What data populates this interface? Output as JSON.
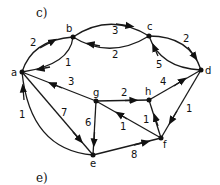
{
  "panel_labels": {
    "top": "c)",
    "bottom": "e)"
  },
  "nodes": [
    {
      "id": "a",
      "label": "a"
    },
    {
      "id": "b",
      "label": "b"
    },
    {
      "id": "c",
      "label": "c"
    },
    {
      "id": "d",
      "label": "d"
    },
    {
      "id": "e",
      "label": "e"
    },
    {
      "id": "f",
      "label": "f"
    },
    {
      "id": "g",
      "label": "g"
    },
    {
      "id": "h",
      "label": "h"
    }
  ],
  "edges": [
    {
      "from": "a",
      "to": "b",
      "weight": "2"
    },
    {
      "from": "b",
      "to": "a",
      "weight": "1"
    },
    {
      "from": "b",
      "to": "c",
      "weight": "3"
    },
    {
      "from": "c",
      "to": "b",
      "weight": "2"
    },
    {
      "from": "c",
      "to": "d",
      "weight": "2"
    },
    {
      "from": "d",
      "to": "c",
      "weight": "5"
    },
    {
      "from": "g",
      "to": "a",
      "weight": "3"
    },
    {
      "from": "g",
      "to": "h",
      "weight": "2"
    },
    {
      "from": "h",
      "to": "d",
      "weight": "4"
    },
    {
      "from": "d",
      "to": "f",
      "weight": "1"
    },
    {
      "from": "f",
      "to": "h",
      "weight": "1"
    },
    {
      "from": "f",
      "to": "g",
      "weight": "1"
    },
    {
      "from": "g",
      "to": "e",
      "weight": "6"
    },
    {
      "from": "a",
      "to": "e",
      "weight": "7"
    },
    {
      "from": "e",
      "to": "a",
      "weight": "1"
    },
    {
      "from": "e",
      "to": "f",
      "weight": "8"
    }
  ]
}
